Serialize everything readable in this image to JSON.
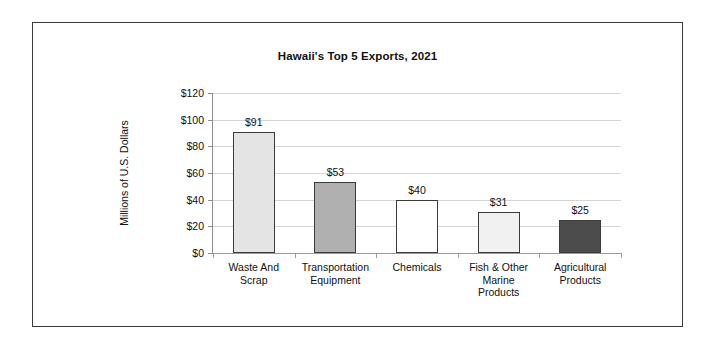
{
  "chart_data": {
    "type": "bar",
    "title": "Hawaii's Top 5 Exports, 2021",
    "xlabel": "",
    "ylabel": "Millions of U.S. Dollars",
    "categories": [
      "Waste And Scrap",
      "Transportation Equipment",
      "Chemicals",
      "Fish & Other Marine Products",
      "Agricultural Products"
    ],
    "values": [
      91,
      53,
      40,
      31,
      25
    ],
    "data_labels": [
      "$91",
      "$53",
      "$40",
      "$31",
      "$25"
    ],
    "ylim": [
      0,
      120
    ],
    "ytick_values": [
      0,
      20,
      40,
      60,
      80,
      100,
      120
    ],
    "ytick_labels": [
      "$0",
      "$20",
      "$40",
      "$60",
      "$80",
      "$100",
      "$120"
    ],
    "grid": true,
    "legend": "none",
    "bar_colors": [
      "#e4e4e4",
      "#b0b0b0",
      "#ffffff",
      "#f1f1f1",
      "#4c4c4c"
    ],
    "bar_border_color": "#3b3b3b",
    "gridline_color": "#d4d4d4",
    "axis_color": "#8c8c8c",
    "frame_color": "#3a3a3a",
    "background_color": "#ffffff",
    "text_color": "#111111"
  }
}
